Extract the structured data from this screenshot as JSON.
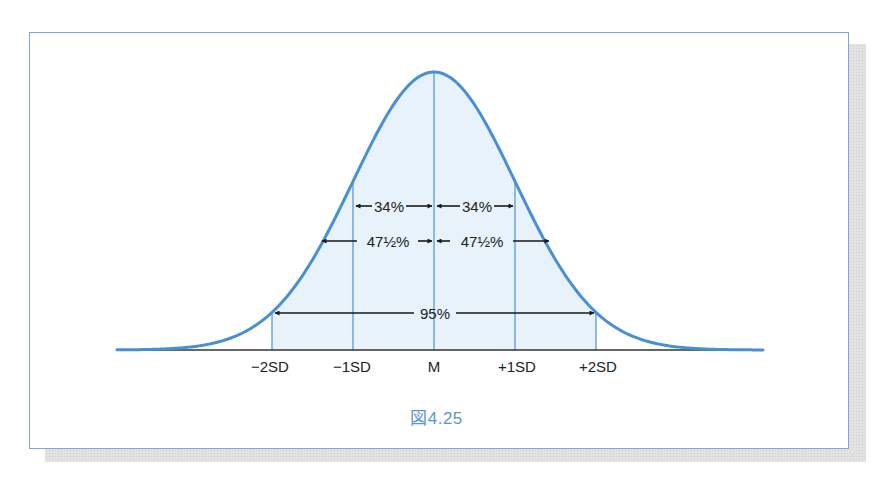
{
  "figure": {
    "caption": "図4.25",
    "colors": {
      "curve": "#4a8fd4",
      "fill": "#e8f2fa",
      "guide_lines": "#6fa6d8",
      "arrows": "#1a1a1a",
      "frame": "#7ba7d4",
      "caption": "#5a95cf"
    }
  },
  "axis": {
    "labels": [
      "−2SD",
      "−1SD",
      "M",
      "+1SD",
      "+2SD"
    ]
  },
  "intervals": {
    "one_sd_left": "34%",
    "one_sd_right": "34%",
    "two_sd_left": "47½%",
    "two_sd_right": "47½%",
    "two_sd_total": "95%"
  },
  "chart_data": {
    "type": "area",
    "title": "図4.25",
    "x_ticks": [
      "−2SD",
      "−1SD",
      "M",
      "+1SD",
      "+2SD"
    ],
    "x_positions_sd": [
      -2,
      -1,
      0,
      1,
      2
    ],
    "shaded_range_sd": [
      -2,
      2
    ],
    "annotations": [
      {
        "from": "M",
        "to": "−1SD",
        "label": "34%"
      },
      {
        "from": "M",
        "to": "+1SD",
        "label": "34%"
      },
      {
        "from": "M",
        "to": "−2SD",
        "label": "47½%"
      },
      {
        "from": "M",
        "to": "+2SD",
        "label": "47½%"
      },
      {
        "from": "−2SD",
        "to": "+2SD",
        "label": "95%"
      }
    ],
    "xlabel": "",
    "ylabel": "",
    "grid": false
  }
}
